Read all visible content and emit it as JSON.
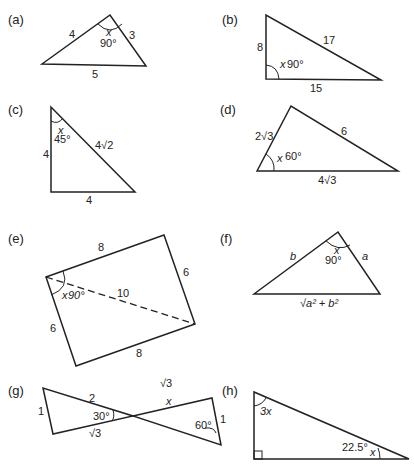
{
  "figures": {
    "a": {
      "label": "(a)",
      "sides": [
        "4",
        "3",
        "5"
      ],
      "angle_var": "x",
      "angle": "90°"
    },
    "b": {
      "label": "(b)",
      "sides": [
        "8",
        "17",
        "15"
      ],
      "angle_var": "x",
      "angle": "90°"
    },
    "c": {
      "label": "(c)",
      "sides": [
        "4",
        "4√2",
        "4"
      ],
      "angle_var": "x",
      "angle": "45°"
    },
    "d": {
      "label": "(d)",
      "sides": [
        "2√3",
        "6",
        "4√3"
      ],
      "angle_var": "x",
      "angle": "60°"
    },
    "e": {
      "label": "(e)",
      "sides": [
        "8",
        "6",
        "6",
        "8"
      ],
      "diagonal": "10",
      "angle_var": "x",
      "angle": "90°"
    },
    "f": {
      "label": "(f)",
      "sides": [
        "b",
        "a",
        "√a² + b²"
      ],
      "angle_var": "x",
      "angle": "90°"
    },
    "g": {
      "label": "(g)",
      "sides": [
        "1",
        "2",
        "√3",
        "√3",
        "x",
        "1"
      ],
      "angles": [
        "30°",
        "60°"
      ]
    },
    "h": {
      "label": "(h)",
      "angle_top": "3x",
      "angle_bottom": "22.5°",
      "angle_var": "x"
    }
  }
}
